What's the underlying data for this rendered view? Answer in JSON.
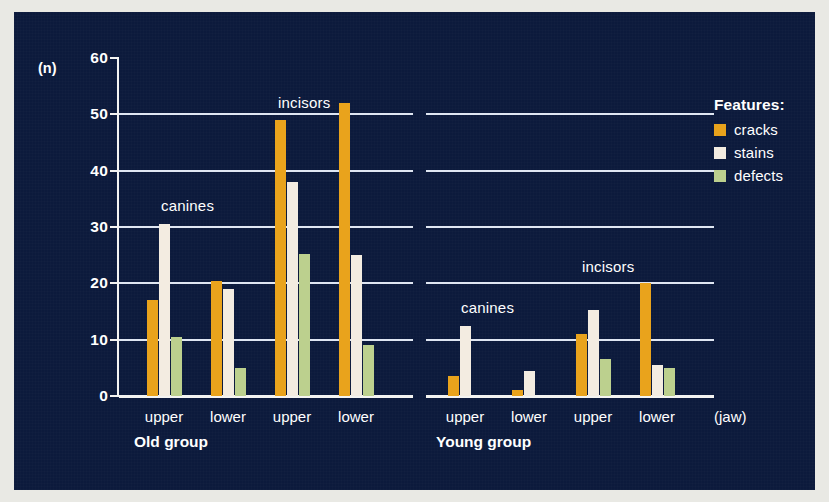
{
  "figure": {
    "background_color": "#0c1a3c",
    "mat_color": "#e9e9e4"
  },
  "axes": {
    "y_unit_label": "(n)",
    "x_caption": "(jaw)",
    "y_ticks": [
      "60",
      "50",
      "40",
      "30",
      "20",
      "10",
      "0"
    ]
  },
  "legend": {
    "title": "Features:",
    "items": [
      {
        "label": "cracks",
        "color": "#e9a31c"
      },
      {
        "label": "stains",
        "color": "#f3ece1"
      },
      {
        "label": "defects",
        "color": "#bcd08e"
      }
    ]
  },
  "groups": [
    {
      "name": "Old group",
      "tooth_labels": [
        "canines",
        "incisors"
      ],
      "jaw_labels": [
        "upper",
        "lower",
        "upper",
        "lower"
      ]
    },
    {
      "name": "Young group",
      "tooth_labels": [
        "canines",
        "incisors"
      ],
      "jaw_labels": [
        "upper",
        "lower",
        "upper",
        "lower"
      ]
    }
  ],
  "chart_data": {
    "type": "bar",
    "title": "",
    "xlabel": "(jaw)",
    "ylabel": "(n)",
    "ylim": [
      0,
      60
    ],
    "ytick_step": 10,
    "grid": true,
    "legend_position": "right",
    "legend_title": "Features:",
    "categories": [
      "Old group / canines / upper",
      "Old group / canines / lower",
      "Old group / incisors / upper",
      "Old group / incisors / lower",
      "Young group / canines / upper",
      "Young group / canines / lower",
      "Young group / incisors / upper",
      "Young group / incisors / lower"
    ],
    "series": [
      {
        "name": "cracks",
        "color": "#e9a31c",
        "values": [
          17,
          20.5,
          49,
          52,
          3.5,
          1,
          11,
          20
        ]
      },
      {
        "name": "stains",
        "color": "#f3ece1",
        "values": [
          30.5,
          19,
          38,
          25,
          12.5,
          4.5,
          15.3,
          5.5
        ]
      },
      {
        "name": "defects",
        "color": "#bcd08e",
        "values": [
          10.5,
          5,
          25.2,
          9,
          0,
          0,
          6.5,
          5
        ]
      }
    ]
  }
}
